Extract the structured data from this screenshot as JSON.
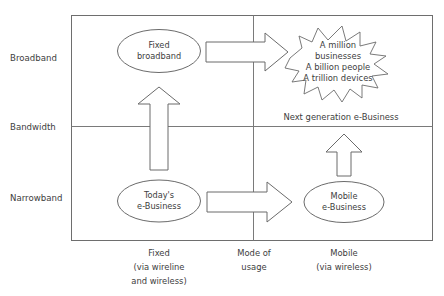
{
  "diagram": {
    "axes": {
      "y_axis_name": "Bandwidth",
      "y_bands": [
        {
          "key": "broadband",
          "label": "Broadband"
        },
        {
          "key": "narrowband",
          "label": "Narrowband"
        }
      ],
      "x_axis_name": "Mode of usage",
      "x_axis_name_line1": "Mode of",
      "x_axis_name_line2": "usage",
      "x_bands": [
        {
          "key": "fixed",
          "label_line1": "Fixed",
          "label_line2": "(via wireline",
          "label_line3": "and wireless)"
        },
        {
          "key": "mobile",
          "label_line1": "Mobile",
          "label_line2": "(via wireless)",
          "label_line3": ""
        }
      ]
    },
    "nodes": [
      {
        "key": "fixed-broadband",
        "shape": "ellipse",
        "line1": "Fixed",
        "line2": "broadband"
      },
      {
        "key": "todays-ebusiness",
        "shape": "ellipse",
        "line1": "Today's",
        "line2": "e-Business"
      },
      {
        "key": "mobile-ebusiness",
        "shape": "ellipse",
        "line1": "Mobile",
        "line2": "e-Business"
      },
      {
        "key": "next-generation-ebusiness",
        "shape": "starburst",
        "line1": "A million",
        "line2": "businesses",
        "line3": "A billion people",
        "line4": "A trillion devices",
        "caption": "Next generation e-Business"
      }
    ],
    "arrows": [
      {
        "key": "arrow-todays-to-fixed-broadband",
        "direction": "up"
      },
      {
        "key": "arrow-fixed-broadband-to-burst",
        "direction": "right"
      },
      {
        "key": "arrow-todays-to-mobile",
        "direction": "right"
      },
      {
        "key": "arrow-mobile-to-burst",
        "direction": "up"
      }
    ],
    "colors": {
      "stroke": "#6b6b6b",
      "text": "#3d3d3d",
      "background": "#ffffff"
    }
  }
}
